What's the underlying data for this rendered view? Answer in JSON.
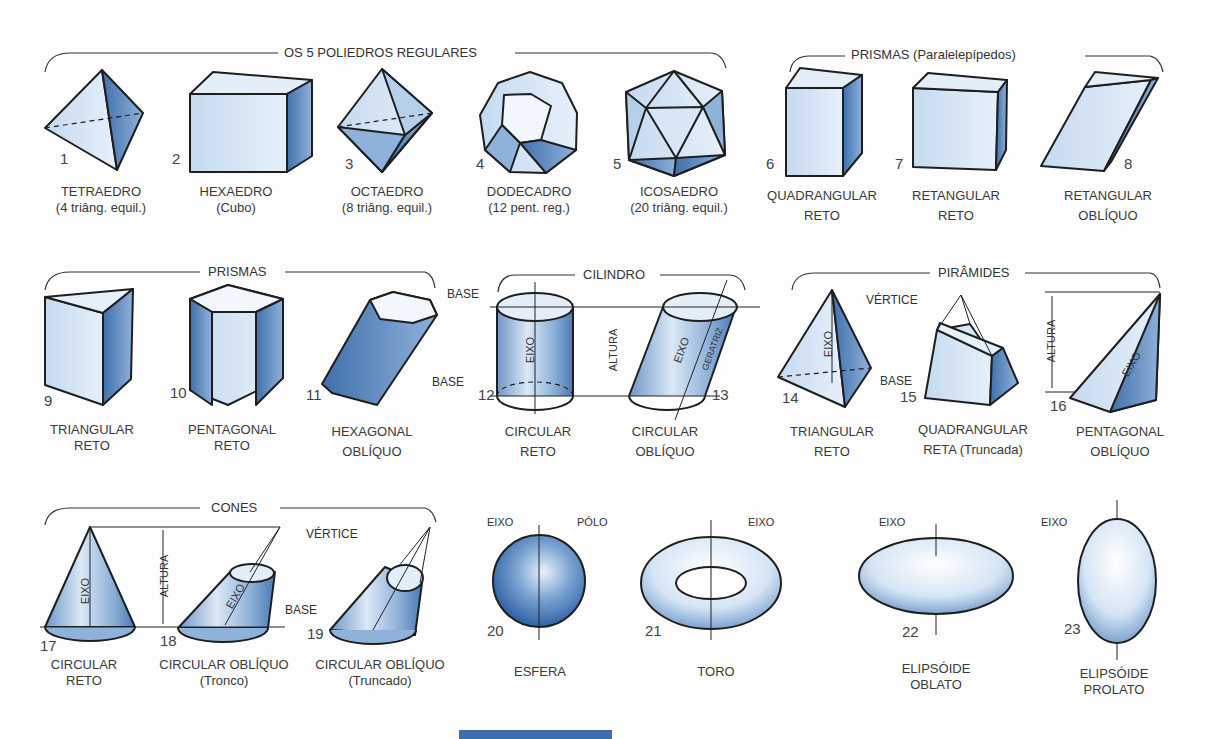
{
  "groups": {
    "poliedros": "OS 5 POLIEDROS REGULARES",
    "paralelepipedos": "PRISMAS (Paralelepípedos)",
    "prismas": "PRISMAS",
    "cilindro": "CILINDRO",
    "piramides": "PIRÂMIDES",
    "cones": "CONES"
  },
  "solids": [
    {
      "n": "1",
      "line1": "TETRAEDRO",
      "line2": "(4 triâng. equil.)"
    },
    {
      "n": "2",
      "line1": "HEXAEDRO",
      "line2": "(Cubo)"
    },
    {
      "n": "3",
      "line1": "OCTAEDRO",
      "line2": "(8 triâng. equil.)"
    },
    {
      "n": "4",
      "line1": "DODECADRO",
      "line2": "(12 pent. reg.)"
    },
    {
      "n": "5",
      "line1": "ICOSAEDRO",
      "line2": "(20 triâng. equil.)"
    },
    {
      "n": "6",
      "line1": "QUADRANGULAR",
      "line2": "RETO"
    },
    {
      "n": "7",
      "line1": "RETANGULAR",
      "line2": "RETO"
    },
    {
      "n": "8",
      "line1": "RETANGULAR",
      "line2": "OBLÍQUO"
    },
    {
      "n": "9",
      "line1": "TRIANGULAR",
      "line2": "RETO"
    },
    {
      "n": "10",
      "line1": "PENTAGONAL",
      "line2": "RETO"
    },
    {
      "n": "11",
      "line1": "HEXAGONAL",
      "line2": "OBLÍQUO"
    },
    {
      "n": "12",
      "line1": "CIRCULAR",
      "line2": "RETO"
    },
    {
      "n": "13",
      "line1": "CIRCULAR",
      "line2": "OBLÍQUO"
    },
    {
      "n": "14",
      "line1": "TRIANGULAR",
      "line2": "RETO"
    },
    {
      "n": "15",
      "line1": "QUADRANGULAR",
      "line2": "RETA (Truncada)"
    },
    {
      "n": "16",
      "line1": "PENTAGONAL",
      "line2": "OBLÍQUO"
    },
    {
      "n": "17",
      "line1": "CIRCULAR",
      "line2": "RETO"
    },
    {
      "n": "18",
      "line1": "CIRCULAR OBLÍQUO",
      "line2": "(Tronco)"
    },
    {
      "n": "19",
      "line1": "CIRCULAR OBLÍQUO",
      "line2": "(Truncado)"
    },
    {
      "n": "20",
      "line1": "ESFERA",
      "line2": ""
    },
    {
      "n": "21",
      "line1": "TORO",
      "line2": ""
    },
    {
      "n": "22",
      "line1": "ELIPSÓIDE",
      "line2": "OBLATO"
    },
    {
      "n": "23",
      "line1": "ELIPSÓIDE",
      "line2": "PROLATO"
    }
  ],
  "annotations": {
    "base": "BASE",
    "eixo": "EIXO",
    "altura": "ALTURA",
    "geratriz": "GERATRIZ",
    "vertice": "VÉRTICE",
    "polo": "PÓLO"
  },
  "colors": {
    "fill_light": "#d6e6f5",
    "fill_mid": "#9fbfe0",
    "fill_dark": "#4f7fb8",
    "stroke": "#1e1e1e",
    "bar": "#3b6fae"
  }
}
